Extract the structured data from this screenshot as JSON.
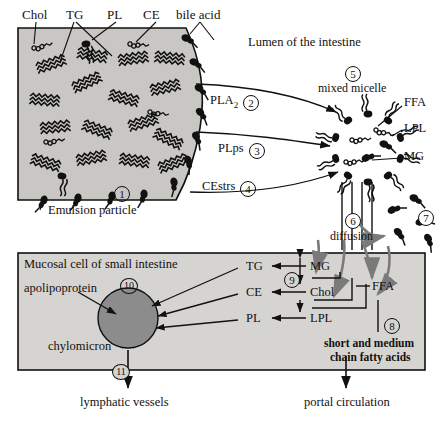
{
  "figure": {
    "lumen_label": "Lumen of the intestine"
  },
  "top_labels": [
    {
      "id": "chol",
      "text": "Chol",
      "x": 22,
      "y": 10
    },
    {
      "id": "tg",
      "text": "TG",
      "x": 68,
      "y": 10
    },
    {
      "id": "pl",
      "text": "PL",
      "x": 110,
      "y": 10
    },
    {
      "id": "ce",
      "text": "CE",
      "x": 148,
      "y": 10
    },
    {
      "id": "bile_acid",
      "text": "bile acid",
      "x": 180,
      "y": 10
    }
  ],
  "lumen": {
    "label": "Lumen of the intestine",
    "x": 248,
    "y": 36
  },
  "emulsion": {
    "label": "Emulsion particle",
    "step": "1",
    "label_x": 62,
    "label_y": 203,
    "step_x": 120,
    "step_y": 190
  },
  "enzymes": [
    {
      "id": "pla2",
      "text": "PLA",
      "sub": "2",
      "step": "2",
      "x": 214,
      "y": 100
    },
    {
      "id": "plps",
      "text": "PLps",
      "sub": "",
      "step": "3",
      "x": 222,
      "y": 148
    },
    {
      "id": "cestrs",
      "text": "CEstrs",
      "sub": "",
      "step": "4",
      "x": 206,
      "y": 186
    }
  ],
  "micelle": {
    "label": "mixed micelle",
    "step": "5",
    "label_x": 322,
    "label_y": 85,
    "step_x": 350,
    "step_y": 71,
    "products": [
      {
        "id": "ffa",
        "text": "FFA",
        "x": 408,
        "y": 103
      },
      {
        "id": "lpl",
        "text": "LPL",
        "x": 408,
        "y": 128
      },
      {
        "id": "mg",
        "text": "MG",
        "x": 408,
        "y": 156
      }
    ]
  },
  "diffusion": {
    "label": "diffusion",
    "step": "6",
    "label_x": 332,
    "label_y": 232,
    "step_x": 350,
    "step_y": 218
  },
  "bile_recycle": {
    "step": "7",
    "step_x": 424,
    "step_y": 216
  },
  "cell": {
    "title": "Mucosal cell of small intestine",
    "title_x": 24,
    "title_y": 258,
    "apolipoprotein": "apolipoprotein",
    "apo_x": 28,
    "apo_y": 285,
    "chylomicron": "chylomicron",
    "chylo_x": 48,
    "chylo_y": 342,
    "chylomicron_step": "10",
    "chylo_step_x": 128,
    "chylo_step_y": 284
  },
  "resynthesis": {
    "step": "9",
    "step_x": 290,
    "step_y": 293,
    "pairs": [
      {
        "product": "TG",
        "px": 248,
        "substrate": "MG",
        "sx": 312,
        "y": 270
      },
      {
        "product": "CE",
        "px": 248,
        "substrate": "Chol",
        "sx": 312,
        "y": 296
      },
      {
        "product": "PL",
        "px": 248,
        "substrate": "LPL",
        "sx": 312,
        "y": 322
      }
    ]
  },
  "ffa_cell": {
    "text": "FFA",
    "x": 374,
    "y": 286
  },
  "short_chain": {
    "line1": "short and medium",
    "line2": "chain fatty acids",
    "step": "8",
    "x": 330,
    "y": 340,
    "step_x": 388,
    "step_y": 322
  },
  "outputs": [
    {
      "id": "lymph",
      "text": "lymphatic vessels",
      "x": 84,
      "y": 400,
      "step": "11",
      "step_x": 118,
      "step_y": 368
    },
    {
      "id": "portal",
      "text": "portal circulation",
      "x": 308,
      "y": 400,
      "step": "",
      "step_x": 0,
      "step_y": 0
    }
  ],
  "colors": {
    "ink": "#111111",
    "emulsion_fill": "#c9c7c3",
    "cell_fill": "#d6d4d0",
    "chylomicron_fill": "#8c8c8c",
    "grey_arrow": "#7a7a7a",
    "page_bg": "#ffffff"
  }
}
